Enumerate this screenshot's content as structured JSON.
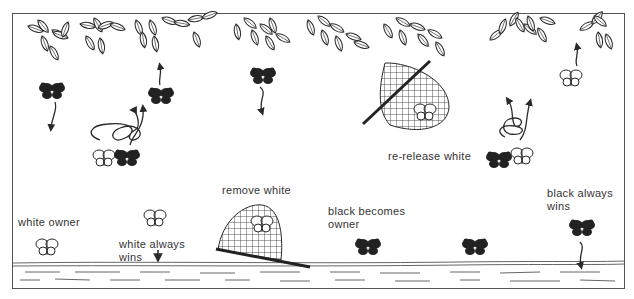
{
  "diagram": {
    "labels": {
      "white_owner": "white owner",
      "white_always_wins_1": "white always",
      "white_always_wins_2": "wins",
      "remove_white": "remove white",
      "black_becomes_owner_1": "black becomes",
      "black_becomes_owner_2": "owner",
      "re_release_white": "re-release white",
      "black_always_wins_1": "black always",
      "black_always_wins_2": "wins"
    },
    "elements": {
      "canopy": "leaf-branches along top",
      "ground": "sunspot ground strip along bottom",
      "butterflies": [
        {
          "color": "black",
          "position": "upper-left",
          "action": "flies down"
        },
        {
          "color": "black",
          "position": "upper-left-center",
          "action": "flies up"
        },
        {
          "color": "white+black",
          "position": "left-center",
          "action": "spiral flight"
        },
        {
          "color": "black",
          "position": "upper-center",
          "action": "flies down"
        },
        {
          "color": "white",
          "position": "center-left ground",
          "action": "owner"
        },
        {
          "color": "white",
          "position": "left-center ground",
          "action": "flies down"
        },
        {
          "color": "white",
          "position": "in net",
          "action": "removed"
        },
        {
          "color": "black",
          "position": "center ground",
          "action": "becomes owner"
        },
        {
          "color": "white",
          "position": "in upper net",
          "action": "captured"
        },
        {
          "color": "white+black",
          "position": "right-center",
          "action": "spiral flight"
        },
        {
          "color": "white",
          "position": "upper-right",
          "action": "flies up"
        },
        {
          "color": "black",
          "position": "right-center ground",
          "action": "owner"
        },
        {
          "color": "black",
          "position": "right ground",
          "action": "flies down"
        }
      ]
    },
    "colors": {
      "ink": "#2a2a2a",
      "background": "#ffffff",
      "frame": "#555555"
    }
  }
}
